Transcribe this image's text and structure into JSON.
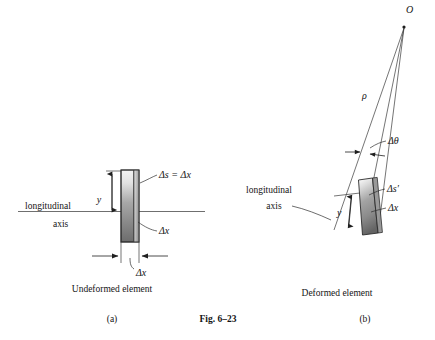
{
  "figure": {
    "number": "Fig. 6–23",
    "panels": [
      {
        "id": "a",
        "tag": "(a)",
        "caption": "Undeformed element",
        "axis_label_top": "longitudinal",
        "axis_label_bottom": "axis",
        "labels": {
          "y": "y",
          "arc_length": "Δs = Δx",
          "delta_x_side": "Δx",
          "delta_x_bottom": "Δx"
        }
      },
      {
        "id": "b",
        "tag": "(b)",
        "caption": "Deformed element",
        "axis_label_top": "longitudinal",
        "axis_label_bottom": "axis",
        "labels": {
          "center_of_curvature": "O",
          "radius": "ρ",
          "delta_theta": "Δθ",
          "y": "y",
          "arc_length": "Δs′",
          "delta_x": "Δx"
        }
      }
    ]
  },
  "colors": {
    "ink": "#141414",
    "line": "#3a3a3a",
    "element_light": "#f2f2f2",
    "element_mid": "#9a9a9a",
    "element_dark": "#5a5a5a",
    "background": "#ffffff"
  }
}
